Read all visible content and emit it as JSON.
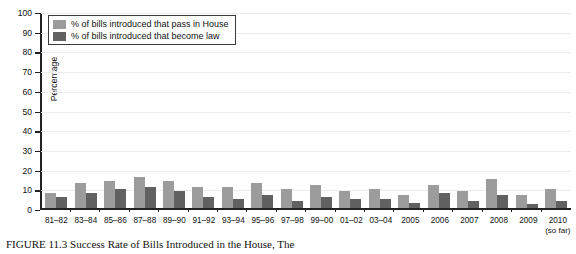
{
  "chart_data": {
    "type": "bar",
    "title": "",
    "xlabel": "",
    "ylabel": "Percentage",
    "ylim": [
      0,
      100
    ],
    "yticks": [
      0,
      10,
      20,
      30,
      40,
      50,
      60,
      70,
      80,
      90,
      100
    ],
    "grid": true,
    "legend_position": "top-left",
    "categories": [
      "81–82",
      "83–84",
      "85–86",
      "87–88",
      "89–90",
      "91–92",
      "93–94",
      "95–96",
      "97–98",
      "99–00",
      "01–02",
      "03–04",
      "2005",
      "2006",
      "2007",
      "2008",
      "2009",
      "2010"
    ],
    "category_notes": {
      "2010": "(so far)"
    },
    "series": [
      {
        "name": "% of bills introduced that pass in House",
        "color": "#9c9c9c",
        "values": [
          8,
          13,
          14,
          16,
          14,
          11,
          11,
          13,
          10,
          12,
          9,
          10,
          7,
          12,
          9,
          15,
          7,
          10
        ]
      },
      {
        "name": "% of bills introduced that become law",
        "color": "#616161",
        "values": [
          6,
          8,
          10,
          11,
          9,
          6,
          5,
          7,
          4,
          6,
          5,
          5,
          3,
          8,
          4,
          7,
          2,
          4
        ]
      }
    ]
  },
  "legend": {
    "items": [
      {
        "label": "% of bills introduced that pass in House",
        "color": "#9c9c9c"
      },
      {
        "label": "% of bills introduced that become law",
        "color": "#616161"
      }
    ]
  },
  "axes": {
    "y_title": "Percentage",
    "y_tick_labels": [
      "100",
      "90",
      "80",
      "70",
      "60",
      "50",
      "40",
      "30",
      "20",
      "10",
      "0"
    ]
  },
  "caption": {
    "text": "FIGURE 11.3   Success Rate of Bills Introduced in the House, The"
  }
}
